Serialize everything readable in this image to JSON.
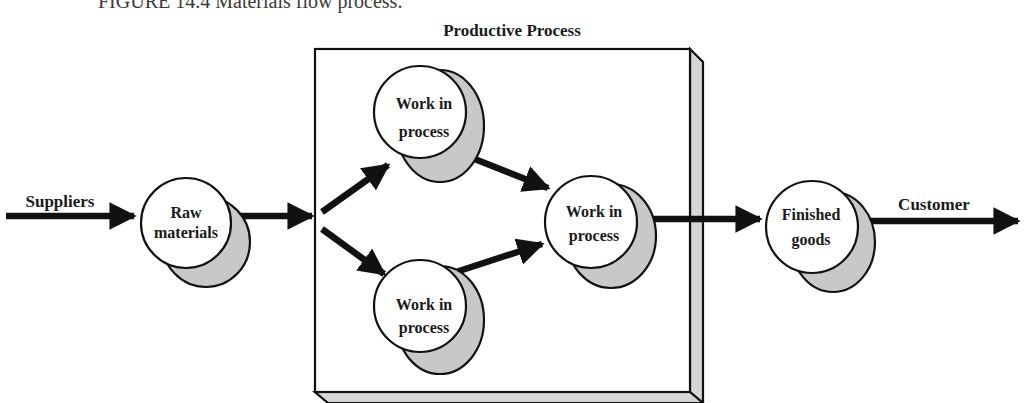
{
  "figure": {
    "caption": "FIGURE 14.4   Materials flow process.",
    "box_title": "Productive Process"
  },
  "nodes": {
    "raw": {
      "line1": "Raw",
      "line2": "materials"
    },
    "wip_top": {
      "line1": "Work in",
      "line2": "process"
    },
    "wip_bottom": {
      "line1": "Work in",
      "line2": "process"
    },
    "wip_center": {
      "line1": "Work in",
      "line2": "process"
    },
    "finished": {
      "line1": "Finished",
      "line2": "goods"
    }
  },
  "edges": {
    "suppliers": "Suppliers",
    "customer": "Customer"
  },
  "colors": {
    "stroke": "#111111",
    "shadow_fill": "#c8c8c8",
    "box_side": "#d6d6d6",
    "node_fill": "#ffffff"
  }
}
